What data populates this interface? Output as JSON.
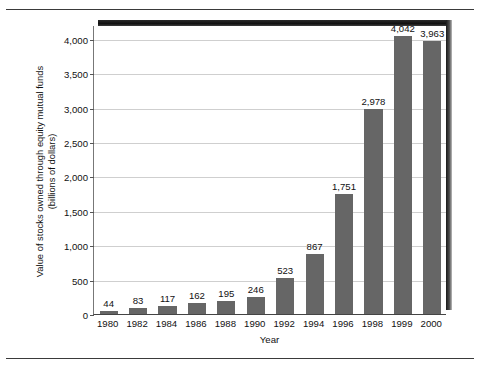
{
  "chart_data": {
    "type": "bar",
    "title": "",
    "xlabel": "Year",
    "ylabel": "Value of stocks owned through equity mutual funds (billions of dollars)",
    "ylabel_lines": [
      "Value of stocks owned through equity mutual funds",
      "(billions of dollars)"
    ],
    "categories": [
      "1980",
      "1982",
      "1984",
      "1986",
      "1988",
      "1990",
      "1992",
      "1994",
      "1996",
      "1998",
      "1999",
      "2000"
    ],
    "values": [
      44,
      83,
      117,
      162,
      195,
      246,
      523,
      867,
      1751,
      2978,
      4042,
      3963
    ],
    "value_labels": [
      "44",
      "83",
      "117",
      "162",
      "195",
      "246",
      "523",
      "867",
      "1,751",
      "2,978",
      "4,042",
      "3,963"
    ],
    "ylim": [
      0,
      4200
    ],
    "yticks": [
      0,
      500,
      1000,
      1500,
      2000,
      2500,
      3000,
      3500,
      4000
    ],
    "ytick_labels": [
      "0",
      "500",
      "1,000",
      "1,500",
      "2,000",
      "2,500",
      "3,000",
      "3,500",
      "4,000"
    ],
    "grid": true,
    "legend": "none",
    "bar_color": "#666666",
    "gridline_color": "#cfcfcf",
    "axis_color": "#444444",
    "background": "#ffffff"
  }
}
